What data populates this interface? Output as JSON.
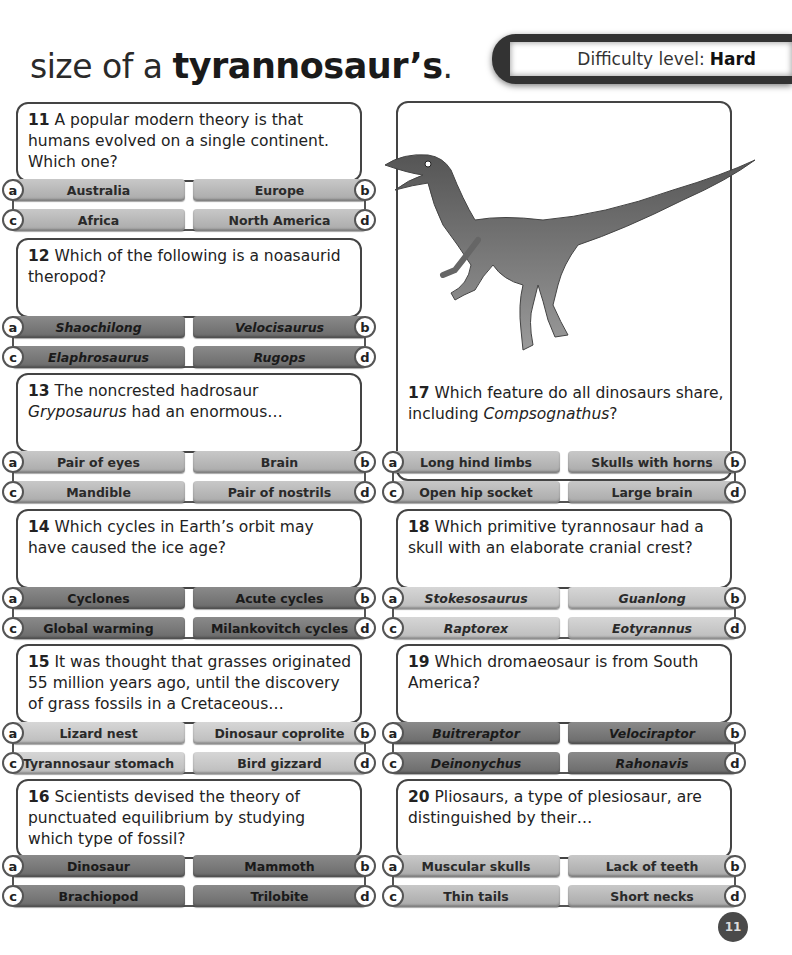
{
  "header": {
    "title_prefix": "size of a ",
    "title_emphasis": "tyrannosaur’s",
    "title_suffix": ".",
    "difficulty_label": "Difficulty level:",
    "difficulty_value": "Hard"
  },
  "image": {
    "subject": "Compsognathus dinosaur illustration"
  },
  "questions": [
    {
      "number": "11",
      "text": "A popular modern theory is that humans evolved on a single continent. Which one?",
      "shade": "mid",
      "italic": false,
      "answers": [
        {
          "letter": "a",
          "label": "Australia"
        },
        {
          "letter": "b",
          "label": "Europe"
        },
        {
          "letter": "c",
          "label": "Africa"
        },
        {
          "letter": "d",
          "label": "North America"
        }
      ]
    },
    {
      "number": "12",
      "text": "Which of the following is a noasaurid theropod?",
      "shade": "dark",
      "italic": true,
      "answers": [
        {
          "letter": "a",
          "label": "Shaochilong"
        },
        {
          "letter": "b",
          "label": "Velocisaurus"
        },
        {
          "letter": "c",
          "label": "Elaphrosaurus"
        },
        {
          "letter": "d",
          "label": "Rugops"
        }
      ]
    },
    {
      "number": "13",
      "text_before": "The noncrested hadrosaur ",
      "text_italic": "Gryposaurus",
      "text_after": " had an enormous…",
      "shade": "mid",
      "italic": false,
      "answers": [
        {
          "letter": "a",
          "label": "Pair of eyes"
        },
        {
          "letter": "b",
          "label": "Brain"
        },
        {
          "letter": "c",
          "label": "Mandible"
        },
        {
          "letter": "d",
          "label": "Pair of nostrils"
        }
      ]
    },
    {
      "number": "14",
      "text": "Which cycles in Earth’s orbit may have caused the ice age?",
      "shade": "dark",
      "italic": false,
      "answers": [
        {
          "letter": "a",
          "label": "Cyclones"
        },
        {
          "letter": "b",
          "label": "Acute cycles"
        },
        {
          "letter": "c",
          "label": "Global warming"
        },
        {
          "letter": "d",
          "label": "Milankovitch cycles"
        }
      ]
    },
    {
      "number": "15",
      "text": "It was thought that grasses originated 55 million years ago, until the discovery of grass fossils in a Cretaceous…",
      "shade": "light",
      "italic": false,
      "answers": [
        {
          "letter": "a",
          "label": "Lizard nest"
        },
        {
          "letter": "b",
          "label": "Dinosaur coprolite"
        },
        {
          "letter": "c",
          "label": "Tyrannosaur stomach"
        },
        {
          "letter": "d",
          "label": "Bird gizzard"
        }
      ]
    },
    {
      "number": "16",
      "text": "Scientists devised the theory of punctuated equilibrium by studying which type of fossil?",
      "shade": "dark",
      "italic": false,
      "answers": [
        {
          "letter": "a",
          "label": "Dinosaur"
        },
        {
          "letter": "b",
          "label": "Mammoth"
        },
        {
          "letter": "c",
          "label": "Brachiopod"
        },
        {
          "letter": "d",
          "label": "Trilobite"
        }
      ]
    },
    {
      "number": "17",
      "text_before": "Which feature do all dinosaurs share, including ",
      "text_italic": "Compsognathus",
      "text_after": "?",
      "shade": "mid",
      "italic": false,
      "answers": [
        {
          "letter": "a",
          "label": "Long hind limbs"
        },
        {
          "letter": "b",
          "label": "Skulls with horns"
        },
        {
          "letter": "c",
          "label": "Open hip socket"
        },
        {
          "letter": "d",
          "label": "Large brain"
        }
      ]
    },
    {
      "number": "18",
      "text": "Which primitive tyrannosaur had a skull with an elaborate cranial crest?",
      "shade": "light",
      "italic": true,
      "answers": [
        {
          "letter": "a",
          "label": "Stokesosaurus"
        },
        {
          "letter": "b",
          "label": "Guanlong"
        },
        {
          "letter": "c",
          "label": "Raptorex"
        },
        {
          "letter": "d",
          "label": "Eotyrannus"
        }
      ]
    },
    {
      "number": "19",
      "text": "Which dromaeosaur is from South America?",
      "shade": "dark",
      "italic": true,
      "answers": [
        {
          "letter": "a",
          "label": "Buitreraptor"
        },
        {
          "letter": "b",
          "label": "Velociraptor"
        },
        {
          "letter": "c",
          "label": "Deinonychus"
        },
        {
          "letter": "d",
          "label": "Rahonavis"
        }
      ]
    },
    {
      "number": "20",
      "text": "Pliosaurs, a type of plesiosaur, are distinguished by their…",
      "shade": "mid",
      "italic": false,
      "answers": [
        {
          "letter": "a",
          "label": "Muscular skulls"
        },
        {
          "letter": "b",
          "label": "Lack of teeth"
        },
        {
          "letter": "c",
          "label": "Thin tails"
        },
        {
          "letter": "d",
          "label": "Short necks"
        }
      ]
    }
  ],
  "footer": {
    "page_number": "11"
  },
  "colors": {
    "dark_answer": "#7a7a7a",
    "mid_answer": "#b5b5b5",
    "light_answer": "#c9c9c9",
    "border": "#444444"
  }
}
